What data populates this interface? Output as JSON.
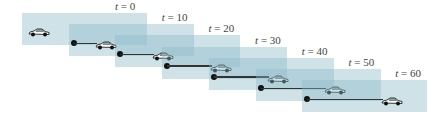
{
  "diagram": {
    "frames": [
      {
        "time_label": "t = 0",
        "t": 0
      },
      {
        "time_label": "t = 10",
        "t": 10
      },
      {
        "time_label": "t = 20",
        "t": 20
      },
      {
        "time_label": "t = 30",
        "t": 30
      },
      {
        "time_label": "t = 40",
        "t": 40
      },
      {
        "time_label": "t = 50",
        "t": 50
      },
      {
        "time_label": "t = 60",
        "t": 60
      }
    ],
    "colors": {
      "frame_fill": "#8cb9c8",
      "track": "#333333",
      "dot": "#111111",
      "car_body": "#ffffff",
      "car_outline": "#222222"
    }
  }
}
